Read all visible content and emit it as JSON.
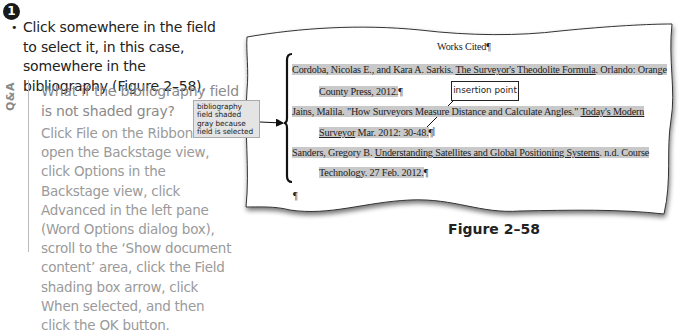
{
  "step": {
    "number": "1",
    "bullet": "•",
    "instruction": "Click somewhere in the field to select it, in this case, somewhere in the bibliography (Figure 2–58)."
  },
  "qa": {
    "label": "Q&A",
    "question": "What if the bibliography field is not shaded gray?",
    "answer": "Click File on the Ribbon to open the Backstage view, click Options in the Backstage view, click Advanced in the left pane (Word Options dialog box), scroll to the ‘Show document content’ area, click the Field shading box arrow, click When selected, and then click the OK button."
  },
  "callouts": {
    "bibliography_field": "bibliography field shaded gray because field is selected",
    "insertion_point": "insertion point"
  },
  "document": {
    "title": "Works Cited¶",
    "entries": [
      {
        "line1_pre": "Cordoba, Nicolas E., and Kara A. Sarkis. ",
        "line1_title": "The Surveyor's Theodolite Formula",
        "line1_post": ". Orlando: Orange",
        "line2": "County Press, 2012.",
        "pilcrow": "¶"
      },
      {
        "line1_pre": "Jains, Malila. \"How Surveyors Measure Distance and Calculate Angles.\" ",
        "line1_title": "Today's Modern",
        "line2_title": "Surveyor",
        "line2_post": " Mar. 2012: 30-48.",
        "pilcrow": "¶"
      },
      {
        "line1_pre": "Sanders, Gregory B. ",
        "line1_title": "Understanding Satellites and Global Positioning Systems",
        "line1_post": ". n.d. Course",
        "line2": "Technology. 27 Feb. 2012.",
        "pilcrow": "¶"
      }
    ],
    "empty_paragraph": "¶",
    "cursor_glyph": "I"
  },
  "figure": {
    "caption": "Figure 2–58"
  },
  "colors": {
    "field_shading": "#c9c9c9",
    "qa_text": "#9a9a9a",
    "callout_fill": "#e4e4e4"
  }
}
